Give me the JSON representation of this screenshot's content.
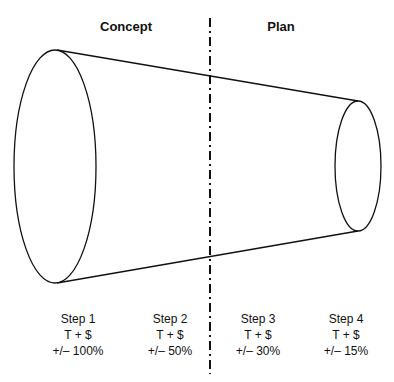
{
  "phases": [
    {
      "label": "Concept"
    },
    {
      "label": "Plan"
    }
  ],
  "steps": [
    {
      "name": "Step 1",
      "measure": "T + $",
      "tolerance": "+/– 100%"
    },
    {
      "name": "Step 2",
      "measure": "T + $",
      "tolerance": "+/– 50%"
    },
    {
      "name": "Step 3",
      "measure": "T + $",
      "tolerance": "+/– 30%"
    },
    {
      "name": "Step 4",
      "measure": "T + $",
      "tolerance": "+/– 15%"
    }
  ],
  "colors": {
    "stroke": "#111111",
    "background": "#ffffff"
  }
}
